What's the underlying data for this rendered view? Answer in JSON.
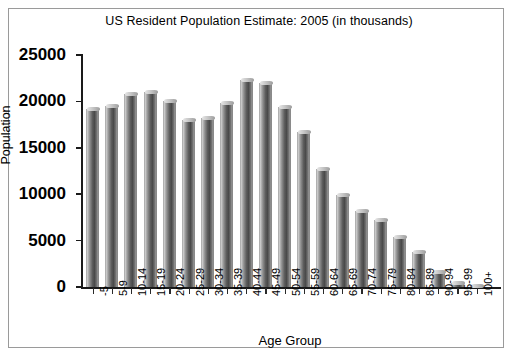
{
  "chart_data": {
    "type": "bar",
    "title": "US Resident Population Estimate: 2005 (in thousands)",
    "xlabel": "Age Group",
    "ylabel": "Population",
    "categories": [
      "-5",
      "5-9",
      "10-14",
      "15-19",
      "20-24",
      "25-29",
      "30-34",
      "35-39",
      "40-44",
      "45-49",
      "50-54",
      "55-59",
      "60-64",
      "65-69",
      "70-74",
      "75-79",
      "80-84",
      "85-89",
      "90-94",
      "95-99",
      "100+"
    ],
    "values": [
      19200,
      19500,
      20800,
      21050,
      20050,
      18000,
      18250,
      19800,
      22300,
      21950,
      19450,
      16700,
      12750,
      9900,
      8150,
      7200,
      5400,
      3800,
      1600,
      450,
      60
    ],
    "ytick_labels": [
      "0",
      "5000",
      "10000",
      "15000",
      "20000",
      "25000"
    ],
    "ytick_values": [
      0,
      5000,
      10000,
      15000,
      20000,
      25000
    ],
    "ylim": [
      0,
      25000
    ],
    "grid": false,
    "legend": null,
    "legend_position": "none",
    "series_style": "3d-cylinder-grayscale"
  },
  "figure": {
    "background_color": "#ffffff",
    "frame_color": "#9a9a9a",
    "axis_color": "#1a1a1a",
    "bar_color": "#5d5d5d"
  }
}
